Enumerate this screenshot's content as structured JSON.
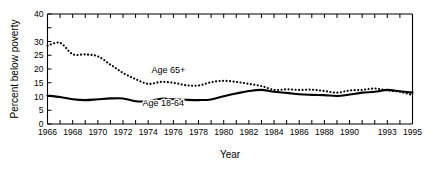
{
  "chart_data": {
    "type": "line",
    "title": "",
    "xlabel": "Year",
    "ylabel": "Percent below poverty",
    "xlim": [
      1966,
      1995
    ],
    "ylim": [
      0,
      40
    ],
    "grid": false,
    "legend_position": "inline-annotation",
    "xticks": [
      1966,
      1967,
      1968,
      1969,
      1970,
      1971,
      1972,
      1973,
      1974,
      1975,
      1976,
      1977,
      1978,
      1979,
      1980,
      1981,
      1982,
      1983,
      1984,
      1985,
      1986,
      1987,
      1988,
      1989,
      1990,
      1991,
      1992,
      1993,
      1994,
      1995
    ],
    "xtick_labels": [
      "1966",
      "",
      "1968",
      "",
      "1970",
      "",
      "1972",
      "",
      "1974",
      "",
      "1976",
      "",
      "1978",
      "",
      "1980",
      "",
      "1982",
      "",
      "1984",
      "",
      "1986",
      "",
      "1988",
      "",
      "1990",
      "",
      "",
      "1993",
      "",
      "1995"
    ],
    "yticks": [
      0,
      5,
      10,
      15,
      20,
      25,
      30,
      35,
      40
    ],
    "ytick_labels": [
      "0",
      "5",
      "10",
      "15",
      "20",
      "25",
      "30",
      "",
      "40"
    ],
    "x": [
      1966,
      1967,
      1968,
      1969,
      1970,
      1971,
      1972,
      1973,
      1974,
      1975,
      1976,
      1977,
      1978,
      1979,
      1980,
      1981,
      1982,
      1983,
      1984,
      1985,
      1986,
      1987,
      1988,
      1989,
      1990,
      1991,
      1992,
      1993,
      1994,
      1995
    ],
    "series": [
      {
        "name": "Age 65+",
        "style": "dotted",
        "label": "Age 65+",
        "label_x": 1975.6,
        "label_y": 18.6,
        "values": [
          28.5,
          29.5,
          25.4,
          25.3,
          24.6,
          21.6,
          18.6,
          16.3,
          14.6,
          15.3,
          15.0,
          14.1,
          14.0,
          15.2,
          15.7,
          15.3,
          14.6,
          13.8,
          12.4,
          12.6,
          12.4,
          12.5,
          12.0,
          11.4,
          12.2,
          12.4,
          12.9,
          12.2,
          11.7,
          10.5
        ]
      },
      {
        "name": "Age 18-64",
        "style": "solid",
        "label": "Age 18-64",
        "label_x": 1975.2,
        "label_y": 6.6,
        "values": [
          10.3,
          9.8,
          9.0,
          8.7,
          9.0,
          9.3,
          9.3,
          8.3,
          8.3,
          9.2,
          9.0,
          8.8,
          8.7,
          8.9,
          10.1,
          11.1,
          12.0,
          12.4,
          11.7,
          11.3,
          10.8,
          10.6,
          10.5,
          10.2,
          10.7,
          11.4,
          11.7,
          12.4,
          11.9,
          11.4
        ]
      }
    ]
  }
}
